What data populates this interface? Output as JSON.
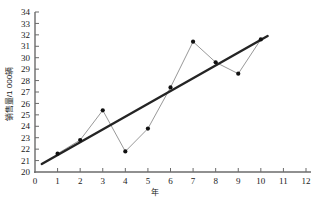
{
  "chart_data": {
    "type": "line",
    "title": "",
    "xlabel": "年",
    "ylabel": "销售量/1 000辆",
    "xlim": [
      0,
      12
    ],
    "ylim": [
      20,
      34
    ],
    "grid": false,
    "legend_position": "none",
    "x_ticks": [
      "0",
      "1",
      "2",
      "3",
      "4",
      "5",
      "6",
      "7",
      "8",
      "9",
      "10",
      "11",
      "12"
    ],
    "y_ticks": [
      "20",
      "21",
      "22",
      "23",
      "24",
      "25",
      "26",
      "27",
      "28",
      "29",
      "30",
      "31",
      "32",
      "33",
      "34"
    ],
    "x": [
      1,
      2,
      3,
      4,
      5,
      6,
      7,
      8,
      9,
      10
    ],
    "series": [
      {
        "name": "销售量",
        "values": [
          21.6,
          22.8,
          25.4,
          21.8,
          23.8,
          27.4,
          31.4,
          29.6,
          28.6,
          31.6
        ]
      }
    ],
    "trend_line": {
      "name": "回归直线",
      "x_start": 0.3,
      "y_start": 20.7,
      "x_end": 10.3,
      "y_end": 31.9
    },
    "colors": {
      "series_line": "#8c8c8c",
      "marker": "#111111",
      "trend_line": "#242424",
      "axis": "#6b6b6b",
      "text": "#1a1a1a"
    }
  }
}
